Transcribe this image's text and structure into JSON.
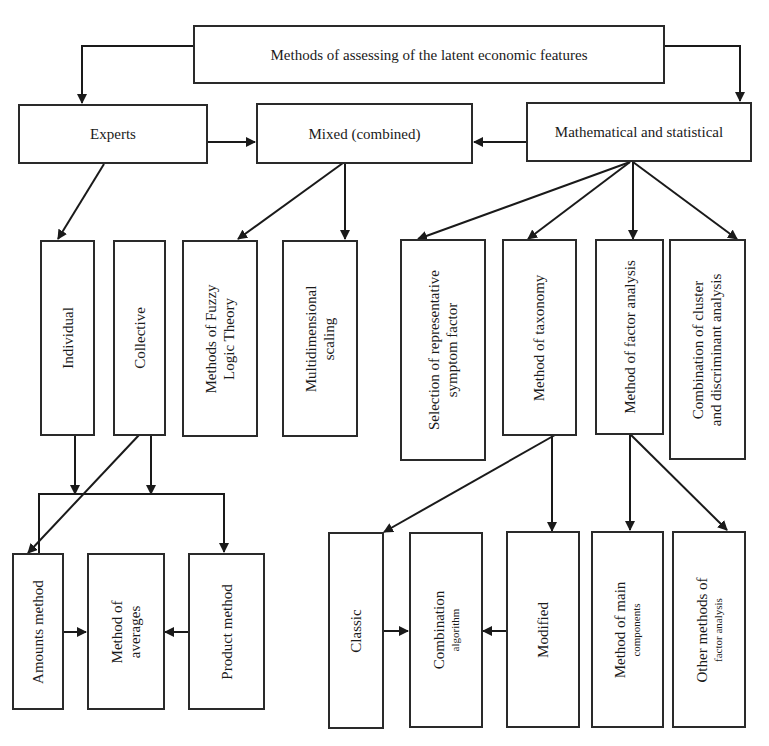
{
  "diagram": {
    "type": "hierarchical flowchart",
    "root": {
      "label": "Methods of assessing of the latent economic features"
    },
    "level1": {
      "experts": {
        "label": "Experts"
      },
      "mixed": {
        "label": "Mixed (combined)"
      },
      "math": {
        "label": "Mathematical and statistical"
      }
    },
    "experts_children": {
      "individual": {
        "label": "Individual"
      },
      "collective": {
        "label": "Collective"
      }
    },
    "mixed_children": {
      "fuzzy": {
        "line1": "Methods of Fuzzy",
        "line2": "Logic Theory"
      },
      "multidim": {
        "line1": "Multidimensional",
        "line2": "scaling"
      }
    },
    "math_children": {
      "selection": {
        "line1": "Selection of representative",
        "line2": "symptom factor"
      },
      "taxonomy": {
        "label": "Method of taxonomy"
      },
      "factor": {
        "label": "Method of factor analysis"
      },
      "cluster": {
        "line1": "Combination of cluster",
        "line2": "and discriminant analysis"
      }
    },
    "expert_methods": {
      "amounts": {
        "label": "Amounts method"
      },
      "averages": {
        "line1": "Method of",
        "line2": "averages"
      },
      "product": {
        "label": "Product method"
      }
    },
    "taxonomy_children": {
      "classic": {
        "label": "Classic"
      },
      "combination": {
        "line1": "Combination",
        "line2": "algorithm"
      },
      "modified": {
        "label": "Modified"
      }
    },
    "factor_children": {
      "main_components": {
        "line1": "Method of main",
        "line2": "components"
      },
      "other": {
        "line1": "Other methods of",
        "line2": "factor analysis"
      }
    },
    "colors": {
      "stroke": "#1a1a1a",
      "background": "#ffffff"
    }
  }
}
